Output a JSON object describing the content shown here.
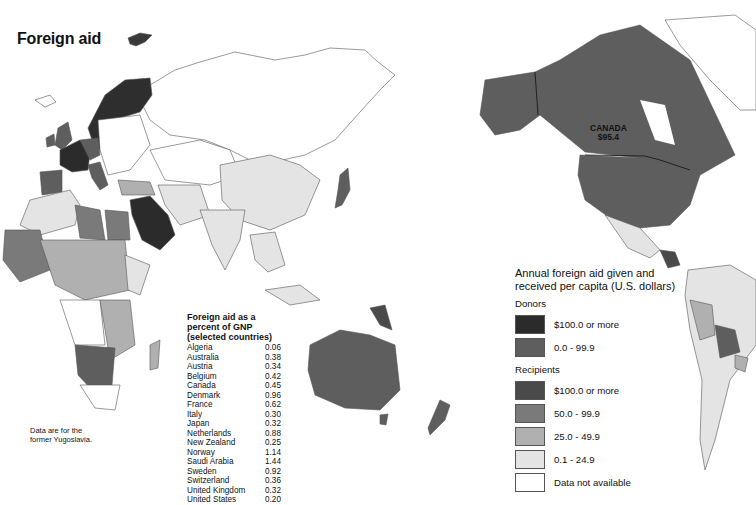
{
  "title": "Foreign aid",
  "map_labels": {
    "canada_name": "CANADA",
    "canada_value": "$95.4"
  },
  "gnp_table": {
    "heading_line1": "Foreign aid as a",
    "heading_line2": "percent of GNP",
    "heading_line3": "(selected countries)",
    "rows": [
      {
        "country": "Algeria",
        "value": "0.06"
      },
      {
        "country": "Australia",
        "value": "0.38"
      },
      {
        "country": "Austria",
        "value": "0.34"
      },
      {
        "country": "Belgium",
        "value": "0.42"
      },
      {
        "country": "Canada",
        "value": "0.45"
      },
      {
        "country": "Denmark",
        "value": "0.96"
      },
      {
        "country": "France",
        "value": "0.62"
      },
      {
        "country": "Italy",
        "value": "0.30"
      },
      {
        "country": "Japan",
        "value": "0.32"
      },
      {
        "country": "Netherlands",
        "value": "0.88"
      },
      {
        "country": "New Zealand",
        "value": "0.25"
      },
      {
        "country": "Norway",
        "value": "1.14"
      },
      {
        "country": "Saudi Arabia",
        "value": "1.44"
      },
      {
        "country": "Sweden",
        "value": "0.92"
      },
      {
        "country": "Switzerland",
        "value": "0.36"
      },
      {
        "country": "United Kingdom",
        "value": "0.32"
      },
      {
        "country": "United States",
        "value": "0.20"
      }
    ]
  },
  "footnote": {
    "line1": "Data are for the",
    "line2": "former Yugoslavia."
  },
  "legend": {
    "title_line1": "Annual foreign aid given and",
    "title_line2": "received per capita (U.S. dollars)",
    "donors_label": "Donors",
    "donors": [
      {
        "label": "$100.0 or more",
        "color": "#2b2b2b"
      },
      {
        "label": "0.0 - 99.9",
        "color": "#5e5e5e"
      }
    ],
    "recipients_label": "Recipients",
    "recipients": [
      {
        "label": "$100.0 or more",
        "color": "#4a4a4a"
      },
      {
        "label": "50.0 - 99.9",
        "color": "#7a7a7a"
      },
      {
        "label": "25.0 - 49.9",
        "color": "#b0b0b0"
      },
      {
        "label": "0.1 - 24.9",
        "color": "#e4e4e4"
      },
      {
        "label": "Data not available",
        "color": "#ffffff"
      }
    ]
  },
  "colors": {
    "donor_high": "#2b2b2b",
    "donor_low": "#5e5e5e",
    "recip_100": "#4a4a4a",
    "recip_50": "#7a7a7a",
    "recip_25": "#b0b0b0",
    "recip_01": "#e4e4e4",
    "na": "#ffffff",
    "border": "#555555"
  }
}
